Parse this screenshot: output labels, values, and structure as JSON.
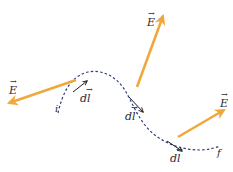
{
  "diagram": {
    "title": "",
    "colors": {
      "field_arrow": "#f0a83c",
      "path": "#2e3f7a",
      "dl_arrow": "#1c1c24",
      "text": "#2a2a33",
      "background": "#ffffff"
    },
    "path": {
      "start_label": "i",
      "end_label": "f",
      "style": "dashed"
    },
    "field_vectors": [
      {
        "label": "E",
        "symbol": "E-vector"
      },
      {
        "label": "E",
        "symbol": "E-vector"
      },
      {
        "label": "E",
        "symbol": "E-vector"
      }
    ],
    "displacement_vectors": [
      {
        "label": "dl",
        "symbol": "dl-vector"
      },
      {
        "label": "dl",
        "symbol": "dl-vector"
      },
      {
        "label": "dl",
        "symbol": "dl-vector"
      }
    ]
  }
}
